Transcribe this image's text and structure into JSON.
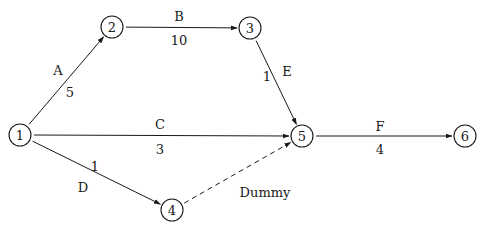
{
  "diagram": {
    "type": "activity-on-arrow network",
    "nodes": [
      {
        "id": "1",
        "label": "1",
        "x": 20,
        "y": 135
      },
      {
        "id": "2",
        "label": "2",
        "x": 112,
        "y": 27
      },
      {
        "id": "3",
        "label": "3",
        "x": 250,
        "y": 28
      },
      {
        "id": "4",
        "label": "4",
        "x": 172,
        "y": 210
      },
      {
        "id": "5",
        "label": "5",
        "x": 302,
        "y": 136
      },
      {
        "id": "6",
        "label": "6",
        "x": 465,
        "y": 136
      }
    ],
    "edges": [
      {
        "from": "1",
        "to": "2",
        "activity": "A",
        "duration": "5",
        "dashed": false,
        "activity_pos": [
          58,
          70
        ],
        "duration_pos": [
          70,
          92
        ]
      },
      {
        "from": "2",
        "to": "3",
        "activity": "B",
        "duration": "10",
        "dashed": false,
        "activity_pos": [
          179,
          16
        ],
        "duration_pos": [
          179,
          40
        ]
      },
      {
        "from": "3",
        "to": "5",
        "activity": "E",
        "duration": "1",
        "dashed": false,
        "activity_pos": [
          287,
          71
        ],
        "duration_pos": [
          267,
          76
        ]
      },
      {
        "from": "1",
        "to": "5",
        "activity": "C",
        "duration": "3",
        "dashed": false,
        "activity_pos": [
          160,
          124
        ],
        "duration_pos": [
          160,
          149
        ]
      },
      {
        "from": "1",
        "to": "4",
        "activity": "D",
        "duration": "1",
        "dashed": false,
        "activity_pos": [
          83,
          187
        ],
        "duration_pos": [
          95,
          166
        ]
      },
      {
        "from": "4",
        "to": "5",
        "activity": "Dummy",
        "duration": "",
        "dashed": true,
        "activity_pos": [
          265,
          192
        ],
        "duration_pos": [
          0,
          0
        ]
      },
      {
        "from": "5",
        "to": "6",
        "activity": "F",
        "duration": "4",
        "dashed": false,
        "activity_pos": [
          380,
          126
        ],
        "duration_pos": [
          380,
          149
        ]
      }
    ]
  },
  "style": {
    "stroke_color": "#1a1a1a",
    "background": "#ffffff",
    "node_radius": 11
  }
}
